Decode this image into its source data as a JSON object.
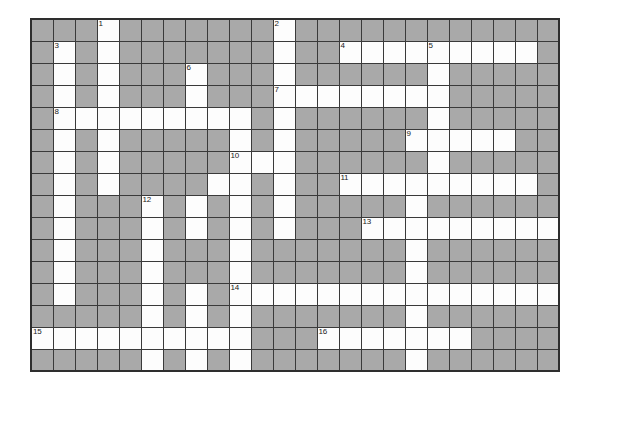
{
  "puzzle": {
    "title": "Crossword Grid",
    "columns": 24,
    "rows": 16,
    "cell_size_px": 22,
    "colors": {
      "block": "#a9a9a9",
      "open": "#fdfdfd",
      "grid_line": "#3a3a3a",
      "border": "#2e2e2e",
      "number_text": "#1a1a1a",
      "page_background": "#ffffff"
    },
    "clue_numbers_visible": [
      1,
      2,
      3,
      4,
      5,
      6,
      7,
      8,
      9,
      10,
      11,
      12,
      13,
      14,
      15,
      16
    ],
    "numbered_cells": [
      {
        "number": 1,
        "row": 0,
        "col": 3
      },
      {
        "number": 2,
        "row": 0,
        "col": 11
      },
      {
        "number": 3,
        "row": 1,
        "col": 1
      },
      {
        "number": 4,
        "row": 1,
        "col": 14
      },
      {
        "number": 5,
        "row": 1,
        "col": 18
      },
      {
        "number": 6,
        "row": 2,
        "col": 7
      },
      {
        "number": 7,
        "row": 3,
        "col": 11
      },
      {
        "number": 8,
        "row": 4,
        "col": 1
      },
      {
        "number": 9,
        "row": 5,
        "col": 17
      },
      {
        "number": 10,
        "row": 6,
        "col": 9
      },
      {
        "number": 11,
        "row": 7,
        "col": 14
      },
      {
        "number": 12,
        "row": 8,
        "col": 5
      },
      {
        "number": 13,
        "row": 9,
        "col": 15
      },
      {
        "number": 14,
        "row": 12,
        "col": 9
      },
      {
        "number": 15,
        "row": 14,
        "col": 0
      },
      {
        "number": 16,
        "row": 14,
        "col": 13
      }
    ],
    "grid": [
      [
        1,
        1,
        1,
        0,
        1,
        1,
        1,
        1,
        1,
        1,
        1,
        0,
        1,
        1,
        1,
        1,
        1,
        1,
        1,
        1,
        1,
        1,
        1,
        1
      ],
      [
        1,
        0,
        1,
        0,
        1,
        1,
        1,
        1,
        1,
        1,
        1,
        0,
        1,
        1,
        0,
        0,
        0,
        0,
        0,
        0,
        0,
        0,
        0,
        1
      ],
      [
        1,
        0,
        1,
        0,
        1,
        1,
        1,
        0,
        1,
        1,
        1,
        0,
        1,
        1,
        1,
        1,
        1,
        1,
        0,
        1,
        1,
        1,
        1,
        1
      ],
      [
        1,
        0,
        1,
        0,
        1,
        1,
        1,
        0,
        1,
        1,
        1,
        0,
        0,
        0,
        0,
        0,
        0,
        0,
        0,
        1,
        1,
        1,
        1,
        1
      ],
      [
        1,
        0,
        0,
        0,
        0,
        0,
        0,
        0,
        0,
        0,
        1,
        0,
        1,
        1,
        1,
        1,
        1,
        1,
        0,
        1,
        1,
        1,
        1,
        1
      ],
      [
        1,
        0,
        1,
        0,
        1,
        1,
        1,
        1,
        1,
        0,
        1,
        0,
        1,
        1,
        1,
        1,
        1,
        0,
        0,
        0,
        0,
        0,
        1,
        1
      ],
      [
        1,
        0,
        1,
        0,
        1,
        1,
        1,
        1,
        1,
        0,
        0,
        0,
        1,
        1,
        1,
        1,
        1,
        1,
        0,
        1,
        1,
        1,
        1,
        1
      ],
      [
        1,
        0,
        1,
        0,
        1,
        1,
        1,
        1,
        0,
        0,
        1,
        0,
        1,
        1,
        0,
        0,
        0,
        0,
        0,
        0,
        0,
        0,
        0,
        1
      ],
      [
        1,
        0,
        1,
        1,
        1,
        0,
        1,
        0,
        1,
        0,
        1,
        0,
        1,
        1,
        1,
        1,
        1,
        0,
        1,
        1,
        1,
        1,
        1,
        1
      ],
      [
        1,
        0,
        1,
        1,
        1,
        0,
        1,
        0,
        1,
        0,
        1,
        0,
        1,
        1,
        1,
        0,
        0,
        0,
        0,
        0,
        0,
        0,
        0,
        0
      ],
      [
        1,
        0,
        1,
        1,
        1,
        0,
        1,
        1,
        1,
        0,
        1,
        1,
        1,
        1,
        1,
        1,
        1,
        0,
        1,
        1,
        1,
        1,
        1,
        1
      ],
      [
        1,
        0,
        1,
        1,
        1,
        0,
        1,
        1,
        1,
        0,
        1,
        1,
        1,
        1,
        1,
        1,
        1,
        0,
        1,
        1,
        1,
        1,
        1,
        1
      ],
      [
        1,
        0,
        1,
        1,
        1,
        0,
        1,
        0,
        1,
        0,
        0,
        0,
        0,
        0,
        0,
        0,
        0,
        0,
        0,
        0,
        0,
        0,
        0,
        0
      ],
      [
        1,
        1,
        1,
        1,
        1,
        0,
        1,
        0,
        1,
        0,
        1,
        1,
        1,
        1,
        1,
        1,
        1,
        0,
        1,
        1,
        1,
        1,
        1,
        1
      ],
      [
        0,
        0,
        0,
        0,
        0,
        0,
        0,
        0,
        0,
        0,
        1,
        1,
        1,
        0,
        0,
        0,
        0,
        0,
        0,
        0,
        1,
        1,
        1,
        1
      ],
      [
        1,
        1,
        1,
        1,
        1,
        0,
        1,
        0,
        1,
        0,
        1,
        1,
        1,
        1,
        1,
        1,
        1,
        0,
        1,
        1,
        1,
        1,
        1,
        1
      ]
    ]
  }
}
